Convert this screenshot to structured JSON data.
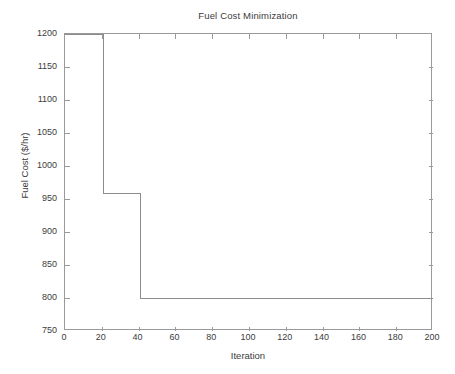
{
  "figure": {
    "background_color": "#ffffff",
    "axis_color": "#9a9a9a",
    "text_color": "#3c3c3c",
    "line_color": "#8c8c8c"
  },
  "chart_data": {
    "type": "line",
    "title": "Fuel Cost Minimization",
    "xlabel": "Iteration",
    "ylabel": "Fuel Cost ($/hr)",
    "xlim": [
      0,
      200
    ],
    "ylim": [
      750,
      1200
    ],
    "grid": false,
    "legend": null,
    "xticks": [
      0,
      20,
      40,
      60,
      80,
      100,
      120,
      140,
      160,
      180,
      200
    ],
    "yticks": [
      750,
      800,
      850,
      900,
      950,
      1000,
      1050,
      1100,
      1150,
      1200
    ],
    "xticklabels": [
      "0",
      "20",
      "40",
      "60",
      "80",
      "100",
      "120",
      "140",
      "160",
      "180",
      "200"
    ],
    "yticklabels": [
      "750",
      "800",
      "850",
      "900",
      "950",
      "1000",
      "1050",
      "1100",
      "1150",
      "1200"
    ],
    "series": [
      {
        "name": "Best fuel cost",
        "style": "step-post",
        "color": "#8c8c8c",
        "x": [
          0,
          21,
          21,
          41,
          41,
          200
        ],
        "y": [
          1200,
          1200,
          958,
          958,
          800,
          800
        ],
        "steps": [
          {
            "x_start": 0,
            "x_end": 21,
            "value": 1200
          },
          {
            "x_start": 21,
            "x_end": 41,
            "value": 958
          },
          {
            "x_start": 41,
            "x_end": 200,
            "value": 800
          }
        ]
      }
    ]
  }
}
